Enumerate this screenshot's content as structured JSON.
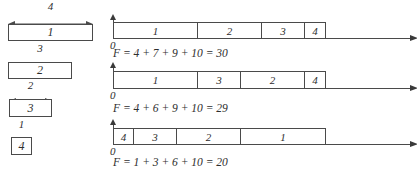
{
  "figure": {
    "colors": {
      "stroke": "#4a4a4a",
      "arrow": "#3a3a3a",
      "text": "#2e2e2e",
      "background": "#ffffff",
      "box_fill": "#ffffff"
    }
  },
  "programs": [
    {
      "box_label": "1",
      "length": 4,
      "length_label": "4"
    },
    {
      "box_label": "2",
      "length": 3,
      "length_label": "3"
    },
    {
      "box_label": "3",
      "length": 2,
      "length_label": "2"
    },
    {
      "box_label": "4",
      "length": 1,
      "length_label": "1"
    }
  ],
  "schedules": [
    {
      "origin_label": "0",
      "order": [
        {
          "label": "1",
          "length": 4
        },
        {
          "label": "2",
          "length": 3
        },
        {
          "label": "3",
          "length": 2
        },
        {
          "label": "4",
          "length": 1
        }
      ],
      "formula": "F = 4 + 7 + 9 + 10 = 30"
    },
    {
      "origin_label": "0",
      "order": [
        {
          "label": "1",
          "length": 4
        },
        {
          "label": "3",
          "length": 2
        },
        {
          "label": "2",
          "length": 3
        },
        {
          "label": "4",
          "length": 1
        }
      ],
      "formula": "F = 4 + 6 + 9 + 10 = 29"
    },
    {
      "origin_label": "0",
      "order": [
        {
          "label": "4",
          "length": 1
        },
        {
          "label": "3",
          "length": 2
        },
        {
          "label": "2",
          "length": 3
        },
        {
          "label": "1",
          "length": 4
        }
      ],
      "formula": "F = 1 + 3 + 6 + 10 = 20"
    }
  ]
}
